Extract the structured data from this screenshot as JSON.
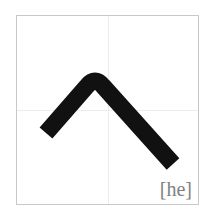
{
  "card": {
    "character": "へ",
    "romanization": "[he]",
    "stroke_color": "#111111",
    "guide_color": "#ececec",
    "border_color": "#c8c8c8",
    "label_color": "#808080"
  }
}
